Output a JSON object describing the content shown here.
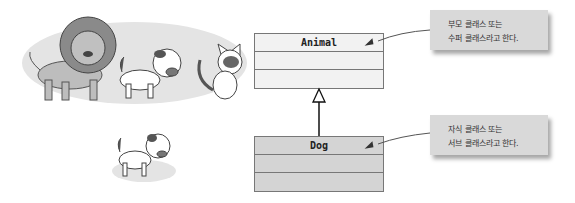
{
  "diagram": {
    "type": "uml-inheritance",
    "parent_class": {
      "name": "Animal",
      "fill": "#f2f2f2",
      "rows": 3
    },
    "child_class": {
      "name": "Dog",
      "fill": "#d4d4d4",
      "rows": 3
    },
    "relationship": "generalization",
    "callouts": [
      {
        "target": "Animal",
        "lines": [
          "부모 클래스 또는",
          "수퍼 클래스라고 한다."
        ]
      },
      {
        "target": "Dog",
        "lines": [
          "자식 클래스 또는",
          "서브 클래스라고 한다."
        ]
      }
    ],
    "illustrations": [
      {
        "name": "lion",
        "group": "animals"
      },
      {
        "name": "dog",
        "group": "animals"
      },
      {
        "name": "cat",
        "group": "animals"
      },
      {
        "name": "dog",
        "group": "single"
      }
    ]
  }
}
